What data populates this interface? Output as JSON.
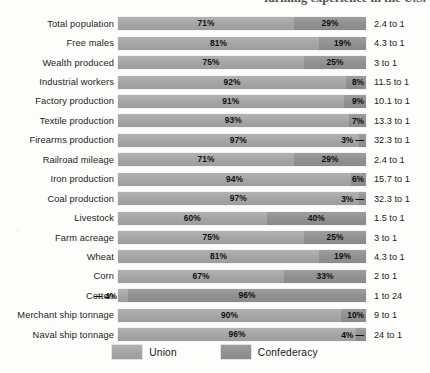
{
  "page": {
    "cut_off_running_text": "farming experience in the U.S."
  },
  "legend": {
    "union_label": "Union",
    "confederacy_label": "Confederacy",
    "union_color": "#a8a8a8",
    "confederacy_color": "#949494"
  },
  "chart_data": {
    "type": "bar",
    "subtype": "stacked-horizontal-100-percent",
    "title": "",
    "xlabel": "",
    "ylabel": "",
    "xlim": [
      0,
      100
    ],
    "grid": false,
    "legend_position": "bottom-center",
    "categories": [
      "Total population",
      "Free males",
      "Wealth produced",
      "Industrial workers",
      "Factory production",
      "Textile production",
      "Firearms production",
      "Railroad mileage",
      "Iron production",
      "Coal production",
      "Livestock",
      "Farm acreage",
      "Wheat",
      "Corn",
      "Cotton",
      "Merchant ship tonnage",
      "Naval ship tonnage"
    ],
    "series": [
      {
        "name": "Union",
        "color": "#a8a8a8",
        "values": [
          71,
          81,
          75,
          92,
          91,
          93,
          97,
          71,
          94,
          97,
          60,
          75,
          81,
          67,
          4,
          90,
          96
        ]
      },
      {
        "name": "Confederacy",
        "color": "#949494",
        "values": [
          29,
          19,
          25,
          8,
          9,
          7,
          3,
          29,
          6,
          3,
          40,
          25,
          19,
          33,
          96,
          10,
          4
        ]
      }
    ],
    "annotations": {
      "ratio_column_label": "",
      "ratios": [
        "2.4 to 1",
        "4.3 to 1",
        "3 to 1",
        "11.5 to 1",
        "10.1 to 1",
        "13.3 to 1",
        "32.3 to 1",
        "2.4 to 1",
        "15.7 to 1",
        "32.3 to 1",
        "1.5 to 1",
        "3 to 1",
        "4.3 to 1",
        "2 to 1",
        "1 to 24",
        "9 to 1",
        "24 to 1"
      ]
    }
  },
  "rows": [
    {
      "label": "Total population",
      "union_pct": 71,
      "union_text": "71%",
      "conf_pct": 29,
      "conf_text": "29%",
      "ratio": "2.4 to 1",
      "union_label_mode": "inside",
      "conf_label_mode": "inside"
    },
    {
      "label": "Free males",
      "union_pct": 81,
      "union_text": "81%",
      "conf_pct": 19,
      "conf_text": "19%",
      "ratio": "4.3 to 1",
      "union_label_mode": "inside",
      "conf_label_mode": "inside"
    },
    {
      "label": "Wealth produced",
      "union_pct": 75,
      "union_text": "75%",
      "conf_pct": 25,
      "conf_text": "25%",
      "ratio": "3 to 1",
      "union_label_mode": "inside",
      "conf_label_mode": "inside"
    },
    {
      "label": "Industrial workers",
      "union_pct": 92,
      "union_text": "92%",
      "conf_pct": 8,
      "conf_text": "8%",
      "ratio": "11.5 to 1",
      "union_label_mode": "inside",
      "conf_label_mode": "inset-right"
    },
    {
      "label": "Factory production",
      "union_pct": 91,
      "union_text": "91%",
      "conf_pct": 9,
      "conf_text": "9%",
      "ratio": "10.1 to 1",
      "union_label_mode": "inside",
      "conf_label_mode": "inset-right"
    },
    {
      "label": "Textile production",
      "union_pct": 93,
      "union_text": "93%",
      "conf_pct": 7,
      "conf_text": "7%",
      "ratio": "13.3 to 1",
      "union_label_mode": "inside",
      "conf_label_mode": "inset-right"
    },
    {
      "label": "Firearms production",
      "union_pct": 97,
      "union_text": "97%",
      "conf_pct": 3,
      "conf_text": "3% —",
      "ratio": "32.3 to 1",
      "union_label_mode": "inside",
      "conf_label_mode": "inset-right"
    },
    {
      "label": "Railroad mileage",
      "union_pct": 71,
      "union_text": "71%",
      "conf_pct": 29,
      "conf_text": "29%",
      "ratio": "2.4 to 1",
      "union_label_mode": "inside",
      "conf_label_mode": "inside"
    },
    {
      "label": "Iron production",
      "union_pct": 94,
      "union_text": "94%",
      "conf_pct": 6,
      "conf_text": "6%",
      "ratio": "15.7 to 1",
      "union_label_mode": "inside",
      "conf_label_mode": "inset-right"
    },
    {
      "label": "Coal production",
      "union_pct": 97,
      "union_text": "97%",
      "conf_pct": 3,
      "conf_text": "3% —",
      "ratio": "32.3 to 1",
      "union_label_mode": "inside",
      "conf_label_mode": "inset-right"
    },
    {
      "label": "Livestock",
      "union_pct": 60,
      "union_text": "60%",
      "conf_pct": 40,
      "conf_text": "40%",
      "ratio": "1.5 to 1",
      "union_label_mode": "inside",
      "conf_label_mode": "inside"
    },
    {
      "label": "Farm acreage",
      "union_pct": 75,
      "union_text": "75%",
      "conf_pct": 25,
      "conf_text": "25%",
      "ratio": "3 to 1",
      "union_label_mode": "inside",
      "conf_label_mode": "inside"
    },
    {
      "label": "Wheat",
      "union_pct": 81,
      "union_text": "81%",
      "conf_pct": 19,
      "conf_text": "19%",
      "ratio": "4.3 to 1",
      "union_label_mode": "inside",
      "conf_label_mode": "inside"
    },
    {
      "label": "Corn",
      "union_pct": 67,
      "union_text": "67%",
      "conf_pct": 33,
      "conf_text": "33%",
      "ratio": "2 to 1",
      "union_label_mode": "inside",
      "conf_label_mode": "inside"
    },
    {
      "label": "Cotton",
      "union_pct": 4,
      "union_text": "— 4%",
      "conf_pct": 96,
      "conf_text": "96%",
      "ratio": "1 to 24",
      "union_label_mode": "outside-left",
      "conf_label_mode": "inside"
    },
    {
      "label": "Merchant ship tonnage",
      "union_pct": 90,
      "union_text": "90%",
      "conf_pct": 10,
      "conf_text": "10%",
      "ratio": "9 to 1",
      "union_label_mode": "inside",
      "conf_label_mode": "inset-right"
    },
    {
      "label": "Naval ship tonnage",
      "union_pct": 96,
      "union_text": "96%",
      "conf_pct": 4,
      "conf_text": "4% —",
      "ratio": "24 to 1",
      "union_label_mode": "inside",
      "conf_label_mode": "inset-right"
    }
  ]
}
